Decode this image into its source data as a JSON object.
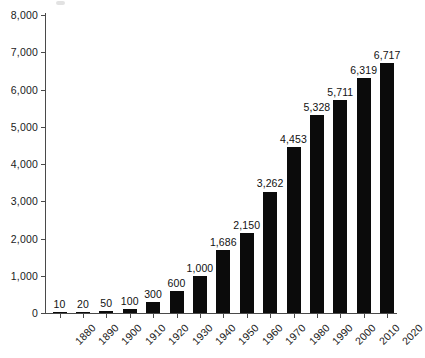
{
  "chart_data": {
    "type": "bar",
    "title": "",
    "subtitle": "",
    "xlabel": "",
    "ylabel": "",
    "categories": [
      "1880",
      "1890",
      "1900",
      "1910",
      "1920",
      "1930",
      "1940",
      "1950",
      "1960",
      "1970",
      "1980",
      "1990",
      "2000",
      "2010",
      "2020"
    ],
    "values": [
      10,
      20,
      50,
      100,
      300,
      600,
      1000,
      1686,
      2150,
      3262,
      4453,
      5328,
      5711,
      6319,
      6717
    ],
    "value_labels": [
      "10",
      "20",
      "50",
      "100",
      "300",
      "600",
      "1,000",
      "1,686",
      "2,150",
      "3,262",
      "4,453",
      "5,328",
      "5,711",
      "6,319",
      "6,717"
    ],
    "ylim": [
      0,
      8000
    ],
    "ytick_values": [
      0,
      1000,
      2000,
      3000,
      4000,
      5000,
      6000,
      7000,
      8000
    ],
    "ytick_labels": [
      "0",
      "1,000",
      "2,000",
      "3,000",
      "4,000",
      "5,000",
      "6,000",
      "7,000",
      "8,000"
    ],
    "grid": false,
    "legend": false,
    "legend_position": "none",
    "bar_color": "#0b0b0b",
    "axis_color": "#4a4a4a",
    "text_color": "#1a1a1a",
    "background": "#ffffff",
    "xtick_rotation": -45,
    "series": [
      {
        "name": "",
        "values": [
          10,
          20,
          50,
          100,
          300,
          600,
          1000,
          1686,
          2150,
          3262,
          4453,
          5328,
          5711,
          6319,
          6717
        ]
      }
    ]
  }
}
